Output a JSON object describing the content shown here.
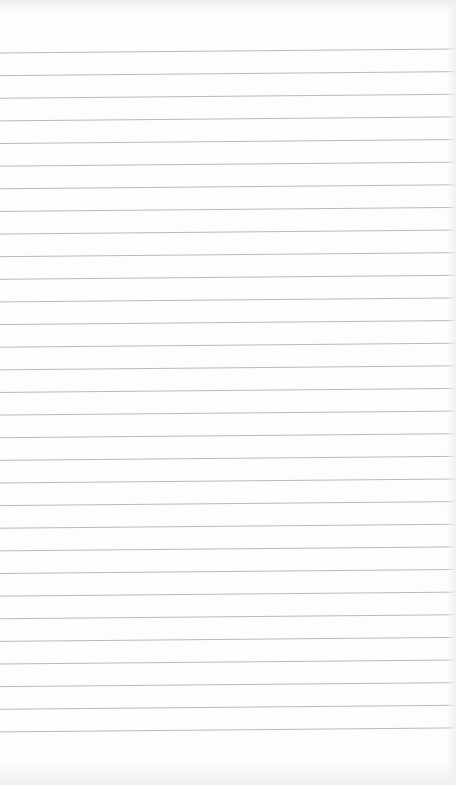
{
  "page": {
    "type": "lined-paper",
    "background_color": "#fdfdfd",
    "line_color": "#b9b9b9",
    "line_count": 31,
    "first_line_y_left": 53,
    "line_spacing": 22.63,
    "slope_px_across_width": -4
  }
}
